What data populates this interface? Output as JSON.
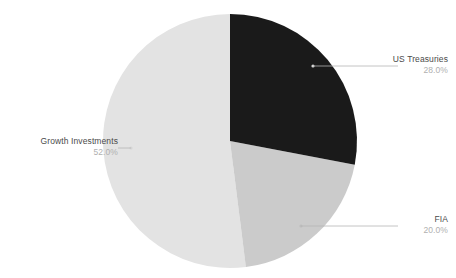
{
  "chart_data": {
    "type": "pie",
    "title": "",
    "subtitle": "",
    "xlabel": "",
    "ylabel": "",
    "legend_position": "none",
    "grid": false,
    "start_angle_deg": 90,
    "direction": "clockwise",
    "background_color": "#ffffff",
    "labels": [
      "US Treasuries",
      "FIA",
      "Growth Investments"
    ],
    "values": [
      28.0,
      20.0,
      52.0
    ],
    "value_labels": [
      "28.0%",
      "20.0%",
      "52.0%"
    ],
    "colors": [
      "#1a1a1a",
      "#cbcbcb",
      "#e3e3e3"
    ],
    "slices": [
      {
        "name": "US Treasuries",
        "value": 28.0,
        "value_label": "28.0%",
        "color": "#1a1a1a",
        "start_deg": 0.0,
        "end_deg": 100.8
      },
      {
        "name": "FIA",
        "value": 20.0,
        "value_label": "20.0%",
        "color": "#cbcbcb",
        "start_deg": 100.8,
        "end_deg": 172.8
      },
      {
        "name": "Growth Investments",
        "value": 52.0,
        "value_label": "52.0%",
        "color": "#e3e3e3",
        "start_deg": 172.8,
        "end_deg": 360.0
      }
    ]
  },
  "callouts": {
    "us_treasuries": {
      "name": "US Treasuries",
      "pct": "28.0%"
    },
    "fia": {
      "name": "FIA",
      "pct": "20.0%"
    },
    "growth_investments": {
      "name": "Growth Investments",
      "pct": "52.0%"
    }
  },
  "style": {
    "label_color": "#4a4a4a",
    "pct_color": "#b0b0b0",
    "leader_color": "#b5b5b5"
  }
}
